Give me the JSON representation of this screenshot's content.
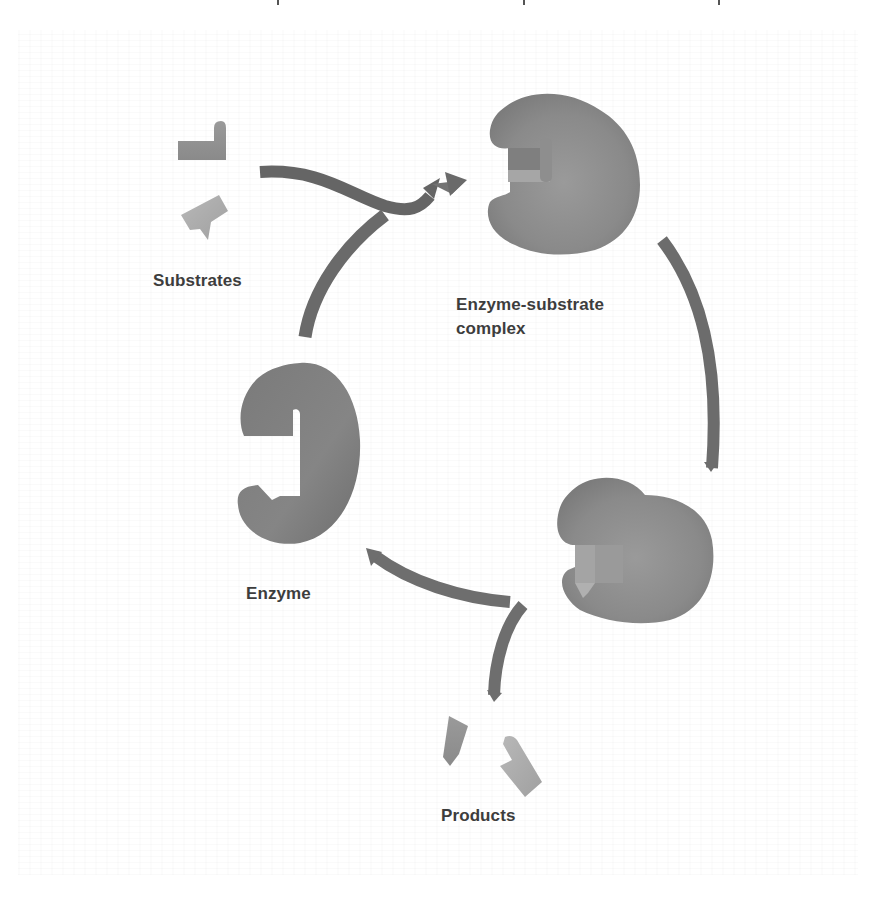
{
  "diagram": {
    "type": "cycle",
    "title": "",
    "colors": {
      "background": "#ffffff",
      "shape_dark": "#6e6e6e",
      "shape_mid": "#8c8c8c",
      "shape_light": "#b5b5b5",
      "arrow": "#6a6a6a",
      "label": "#3d3d3d"
    },
    "nodes": [
      {
        "id": "substrates",
        "label": "Substrates"
      },
      {
        "id": "complex",
        "label_line1": "Enzyme-substrate",
        "label_line2": "complex"
      },
      {
        "id": "product_bound",
        "label": ""
      },
      {
        "id": "products",
        "label": "Products"
      },
      {
        "id": "enzyme",
        "label": "Enzyme"
      }
    ],
    "edges": [
      {
        "from": "substrates",
        "to": "complex"
      },
      {
        "from": "enzyme",
        "to": "complex"
      },
      {
        "from": "complex",
        "to": "product_bound"
      },
      {
        "from": "product_bound",
        "to": "enzyme"
      },
      {
        "from": "product_bound",
        "to": "products"
      }
    ],
    "labels": {
      "substrates": "Substrates",
      "complex_line1": "Enzyme-substrate",
      "complex_line2": "complex",
      "enzyme": "Enzyme",
      "products": "Products"
    }
  }
}
